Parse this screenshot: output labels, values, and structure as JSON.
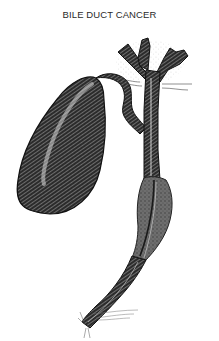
{
  "figure": {
    "title": "BILE DUCT CANCER",
    "colors": {
      "background": "#ffffff",
      "ink": "#1a1a1a",
      "tumor": "#6e6e6e",
      "highlight": "#d8d8d8"
    }
  }
}
